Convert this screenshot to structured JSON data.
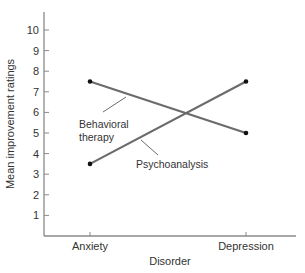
{
  "chart_data": {
    "type": "line",
    "title": "",
    "xlabel": "Disorder",
    "ylabel": "Mean improvement ratings",
    "categories": [
      "Anxiety",
      "Depression"
    ],
    "ylim": [
      0,
      11
    ],
    "yticks": [
      1,
      2,
      3,
      4,
      5,
      6,
      7,
      8,
      9,
      10
    ],
    "grid": false,
    "legend": "inline labels with leader lines",
    "series": [
      {
        "name": "Behavioral therapy",
        "label_lines": [
          "Behavioral",
          "therapy"
        ],
        "values": [
          7.5,
          5.0
        ]
      },
      {
        "name": "Psychoanalysis",
        "label_lines": [
          "Psychoanalysis"
        ],
        "values": [
          3.5,
          7.5
        ]
      }
    ]
  },
  "colors": {
    "line": "#6b6b6b",
    "axis": "#8a8a8a",
    "marker": "#111111",
    "text": "#333333"
  }
}
